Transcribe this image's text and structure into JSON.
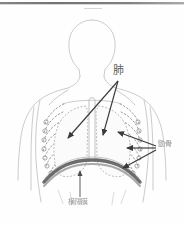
{
  "page": {
    "background_color": "#fefefe",
    "scan_edge_color": "#6f6f6f"
  },
  "diagram": {
    "type": "anatomical-illustration",
    "view": "anterior",
    "line_color": "#b9b9b9",
    "rib_color": "#9d9d9d",
    "diaphragm_color": "#5c5c5c",
    "arrow_color": "#3a3a3a",
    "parts": [
      {
        "id": "head",
        "name": "頭部輪郭"
      },
      {
        "id": "neck",
        "name": "首輪郭"
      },
      {
        "id": "shoulders",
        "name": "肩輪郭"
      },
      {
        "id": "arms",
        "name": "腕輪郭"
      },
      {
        "id": "ribcage",
        "name": "胸郭"
      },
      {
        "id": "lung-left",
        "name": "左肺"
      },
      {
        "id": "lung-right",
        "name": "右肺"
      },
      {
        "id": "trachea",
        "name": "気管"
      },
      {
        "id": "diaphragm",
        "name": "横隔膜"
      }
    ]
  },
  "labels": {
    "lung": {
      "text": "肺",
      "romaji": "hai",
      "meaning": "lung",
      "x": 113,
      "y": 65,
      "arrow_count": 2
    },
    "ribs": {
      "text": "勯骨",
      "romaji": "rokkotsu",
      "meaning": "ribs",
      "x": 158,
      "y": 141,
      "arrow_count": 3
    },
    "diaphragm": {
      "text": "横隔膜",
      "romaji": "oukakumaku",
      "meaning": "diaphragm",
      "x": 68,
      "y": 199,
      "arrow_count": 1
    }
  },
  "arrows": [
    {
      "id": "lung-left-arrow",
      "from_label": "lung",
      "to_part": "lung-left"
    },
    {
      "id": "lung-right-arrow",
      "from_label": "lung",
      "to_part": "lung-right"
    },
    {
      "id": "rib-arrow-upper",
      "from_label": "ribs",
      "to_part": "ribcage"
    },
    {
      "id": "rib-arrow-middle",
      "from_label": "ribs",
      "to_part": "ribcage"
    },
    {
      "id": "rib-arrow-lower",
      "from_label": "ribs",
      "to_part": "ribcage"
    },
    {
      "id": "diaphragm-arrow",
      "from_label": "diaphragm",
      "to_part": "diaphragm"
    }
  ]
}
